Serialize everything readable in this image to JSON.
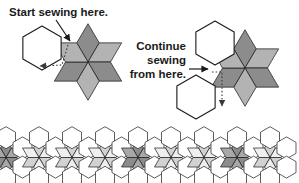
{
  "figure": {
    "background_color": "#ffffff"
  },
  "annotations": {
    "start_label": "Start sewing here.",
    "continue_label_line1": "Continue",
    "continue_label_line2": "sewing",
    "continue_label_line3": "from here."
  },
  "colors": {
    "outline": "#1a1a1a",
    "diamond_dark": "#8c8c8c",
    "diamond_light": "#b3b3b3",
    "hexagon_fill": "#ffffff",
    "arrow": "#1a1a1a",
    "dotted_guide": "#4d4d4d",
    "band_star_dark": "#8c8c8c",
    "band_star_light": "#c4c4c4",
    "band_hex_white": "#ffffff"
  },
  "diagram_left": {
    "name": "step-one",
    "hexagon": {
      "cx": 42,
      "cy": 48,
      "r": 22
    },
    "star": {
      "cx": 88,
      "cy": 62,
      "r": 38
    },
    "arrow_solid": {
      "from_x": 58,
      "from_y": 22,
      "to_x": 70,
      "to_y": 42
    },
    "dotted_path": [
      [
        68,
        44
      ],
      [
        62,
        64
      ],
      [
        38,
        66
      ]
    ]
  },
  "diagram_right": {
    "name": "step-two",
    "hexagon_attached": {
      "cx": 215,
      "cy": 43,
      "r": 22
    },
    "hexagon_loose": {
      "cx": 196,
      "cy": 95,
      "r": 22
    },
    "star": {
      "cx": 245,
      "cy": 68,
      "r": 38
    },
    "arrow_solid": {
      "from_x": 178,
      "from_y": 69,
      "to_x": 207,
      "to_y": 69
    },
    "dotted_path": [
      [
        212,
        72
      ],
      [
        222,
        72
      ],
      [
        222,
        108
      ]
    ]
  },
  "band": {
    "name": "pieced-border-strip",
    "y_top": 139,
    "y_bottom": 176,
    "repeat_count": 9,
    "unit_width": 33,
    "star_shades": [
      "dark",
      "light",
      "light",
      "light",
      "dark",
      "light",
      "light",
      "dark",
      "light"
    ]
  },
  "chart_data": {
    "type": "diagram",
    "steps": [
      {
        "step": 1,
        "label": "Start sewing here.",
        "shapes": [
          "hexagon",
          "six-point-star"
        ]
      },
      {
        "step": 2,
        "label": "Continue sewing from here.",
        "shapes": [
          "hexagon",
          "six-point-star",
          "hexagon"
        ]
      }
    ],
    "border_strip": {
      "units": 9,
      "motif": "star-and-hexagon"
    }
  }
}
